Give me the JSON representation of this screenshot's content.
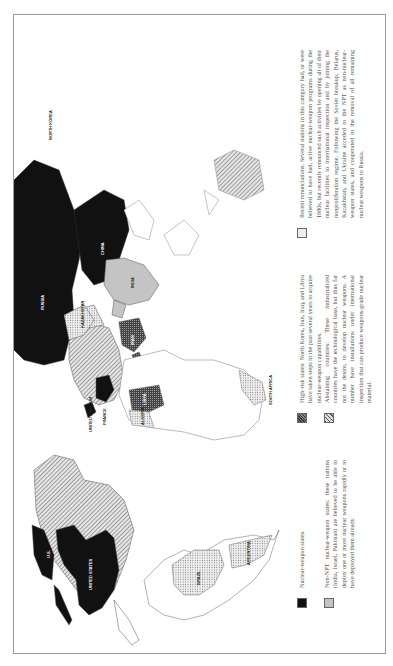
{
  "legend": {
    "items": [
      {
        "key": "nuclear",
        "swatch": "black",
        "text": "Nuclear-weapon states."
      },
      {
        "key": "non_npt",
        "swatch": "gray",
        "text": "Non-NPT nuclear-weapon states: these nations (India, Israel, Pakistan) are believed to be able to deploy one or more nuclear weapons rapidly or to have deployed them already."
      },
      {
        "key": "high_risk",
        "swatch": "dark-crosshatch",
        "text": "High-risk states: North Korea, Iran, Iraq, and Libya have taken steps in the past several years to acquire nuclear-weapon capabilities."
      },
      {
        "key": "abstaining",
        "swatch": "diagonal-hatch",
        "text": "Abstaining countries: These industrialized countries have the technological base, but thus far not the desire, to develop nuclear weapons. A number have installations under international inspection that can produce weapons-grade nuclear material."
      },
      {
        "key": "renunciations",
        "swatch": "dotted",
        "text": "Recent renunciations: Several nations in this category had, or were believed to have had, active nuclear-weapon programs during the 1980s, but recently renounced such activities by opening all of their nuclear facilities to international inspection and by joining the nonproliferation regime. Following the Soviet breakup, Belarus, Kazakhstan, and Ukraine acceded to the NPT as non-nuclear-weapon states, and cooperated in the removal of all remaining nuclear weapons to Russia."
      }
    ]
  },
  "map": {
    "labels": {
      "us": "UNITED STATES",
      "uk": "UNITED KINGDOM",
      "france": "FRANCE",
      "russia": "RUSSIA",
      "china": "CHINA",
      "north_korea": "NORTH KOREA",
      "india": "INDIA",
      "brazil": "BRAZIL",
      "argentina": "ARGENTINA",
      "south_africa": "SOUTH AFRICA",
      "libya": "LIBYA",
      "algeria": "ALGERIA",
      "ukraine": "UKRAINE",
      "kazakhstan": "KAZAKHSTAN",
      "iran": "IRAN",
      "iraq": "IRAQ",
      "israel": "ISRAEL",
      "pakistan": "PAKISTAN",
      "us_alaska": "U.S."
    },
    "colors": {
      "nuclear": "#111111",
      "non_npt": "#c4c4c4",
      "border": "#666666"
    }
  }
}
